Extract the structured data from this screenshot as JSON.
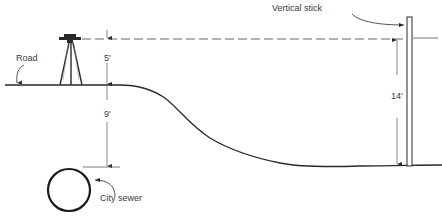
{
  "diagram": {
    "type": "surveying-cross-section",
    "labels": {
      "road": "Road",
      "vertical_stick": "Vertical stick",
      "city_sewer": "City sewer"
    },
    "dimensions": {
      "instrument_height": "5'",
      "sewer_depth": "9'",
      "stick_reading": "14'"
    },
    "colors": {
      "line": "#2a2a2a",
      "dash": "#555555",
      "background": "#ffffff"
    }
  }
}
